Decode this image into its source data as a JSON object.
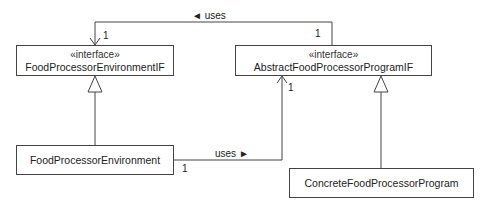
{
  "diagram": {
    "type": "UML class diagram",
    "classes": [
      {
        "id": "fpe_if",
        "stereotype": "«interface»",
        "name": "FoodProcessorEnvironmentIF"
      },
      {
        "id": "afpp_if",
        "stereotype": "«interface»",
        "name": "AbstractFoodProcessorProgramIF"
      },
      {
        "id": "fpe",
        "name": "FoodProcessorEnvironment"
      },
      {
        "id": "cfpp",
        "name": "ConcreteFoodProcessorProgram"
      }
    ],
    "associations": [
      {
        "from": "afpp_if",
        "to": "fpe_if",
        "label": "◄ uses",
        "mult_from": "1",
        "mult_to": "1"
      },
      {
        "from": "fpe",
        "to": "afpp_if",
        "label": "uses ►",
        "mult_from": "1",
        "mult_to": "1"
      }
    ],
    "realizations": [
      {
        "from": "fpe",
        "to": "fpe_if"
      },
      {
        "from": "cfpp",
        "to": "afpp_if"
      }
    ]
  },
  "colors": {
    "line": "#444444",
    "background": "#ffffff"
  }
}
